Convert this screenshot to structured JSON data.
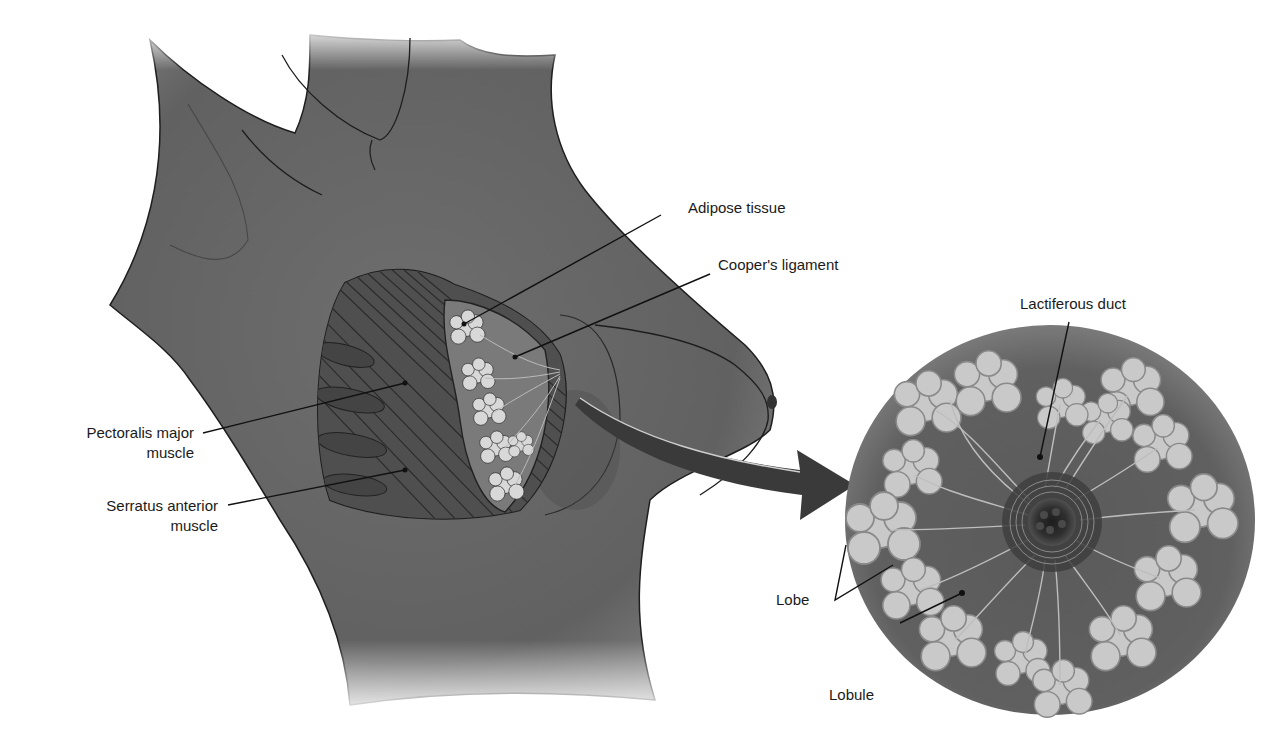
{
  "figure": {
    "colors": {
      "skin": "#6b6b6b",
      "skin_dark": "#4e4e4e",
      "muscle": "#555555",
      "lobule": "#cfcfcf",
      "outline": "#1e1e1e",
      "background": "#ffffff"
    }
  },
  "labels": {
    "adipose_tissue": "Adipose tissue",
    "coopers_ligament": "Cooper's ligament",
    "pectoralis_line1": "Pectoralis major",
    "pectoralis_line2": "muscle",
    "serratus_line1": "Serratus anterior",
    "serratus_line2": "muscle",
    "lactiferous_duct": "Lactiferous duct",
    "lobe": "Lobe",
    "lobule": "Lobule"
  }
}
